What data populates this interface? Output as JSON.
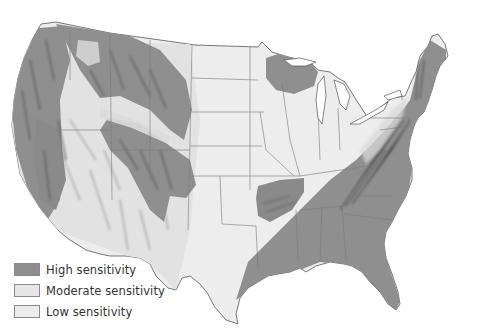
{
  "map": {
    "subject": "Contiguous United States",
    "regions": [
      {
        "name": "Western mountains (Cascades, Sierra Nevada, Rockies)",
        "category": "high"
      },
      {
        "name": "Upper Great Lakes (northern Wisconsin / Upper Peninsula)",
        "category": "high"
      },
      {
        "name": "Ozark region (Arkansas / Missouri)",
        "category": "high"
      },
      {
        "name": "Southeast and Appalachians",
        "category": "high"
      },
      {
        "name": "New England and New York",
        "category": "high"
      },
      {
        "name": "Great Plains and Midwest",
        "category": "low"
      },
      {
        "name": "Great Basin / Southwest interior",
        "category": "moderate"
      }
    ]
  },
  "legend": {
    "items": [
      {
        "label": "High sensitivity",
        "color": "#8f8f8f"
      },
      {
        "label": "Moderate sensitivity",
        "color": "#e6e6e6"
      },
      {
        "label": "Low sensitivity",
        "color": "#ececec"
      }
    ]
  },
  "colors": {
    "high": "#8f8f8f",
    "high_shadow": "#6e6e6e",
    "moderate": "#e4e4e4",
    "low": "#ededed",
    "border": "#7a7a7a",
    "land_outline": "#555555"
  }
}
